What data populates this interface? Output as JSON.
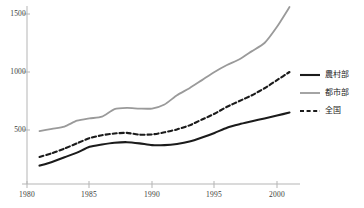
{
  "chart_data": {
    "type": "line",
    "title": "",
    "xlabel": "",
    "ylabel": "",
    "xlim": [
      1980,
      2001.5
    ],
    "ylim": [
      0,
      1650
    ],
    "grid": false,
    "legend_position": "right",
    "xticks": [
      "1980",
      "1985",
      "1990",
      "1995",
      "2000"
    ],
    "xtick_values": [
      1980,
      1985,
      1990,
      1995,
      2000
    ],
    "yticks": [
      "500",
      "1000",
      "1500"
    ],
    "ytick_values": [
      500,
      1000,
      1500
    ],
    "x": [
      1981,
      1982,
      1983,
      1984,
      1985,
      1986,
      1987,
      1988,
      1989,
      1990,
      1991,
      1992,
      1993,
      1994,
      1995,
      1996,
      1997,
      1998,
      1999,
      2000,
      2001
    ],
    "series": [
      {
        "name": "農村部",
        "style": "solid",
        "color": "#1b1b1b",
        "width": 2.1,
        "values": [
          193,
          225,
          265,
          305,
          355,
          375,
          390,
          395,
          385,
          370,
          370,
          380,
          400,
          435,
          475,
          520,
          550,
          575,
          600,
          625,
          650
        ]
      },
      {
        "name": "都市部",
        "style": "solid",
        "color": "#9a9a9a",
        "width": 1.8,
        "values": [
          490,
          510,
          530,
          580,
          600,
          615,
          680,
          690,
          685,
          685,
          720,
          800,
          860,
          930,
          1000,
          1060,
          1110,
          1180,
          1250,
          1390,
          1560
        ]
      },
      {
        "name": "全国",
        "style": "dashed",
        "color": "#1b1b1b",
        "width": 2.1,
        "values": [
          268,
          300,
          340,
          385,
          430,
          455,
          470,
          475,
          460,
          462,
          480,
          505,
          540,
          590,
          640,
          700,
          750,
          800,
          860,
          930,
          1000
        ]
      }
    ]
  },
  "legend": {
    "items": [
      {
        "label": "農村部",
        "style": "solid",
        "color": "#1b1b1b"
      },
      {
        "label": "都市部",
        "style": "solid",
        "color": "#9a9a9a"
      },
      {
        "label": "全国",
        "style": "dashed",
        "color": "#1b1b1b"
      }
    ]
  },
  "axes": {
    "x_labels": [
      "1980",
      "1985",
      "1990",
      "1995",
      "2000"
    ],
    "y_labels": [
      "1500",
      "1000",
      "500"
    ]
  },
  "footnote": {
    "text": ""
  }
}
